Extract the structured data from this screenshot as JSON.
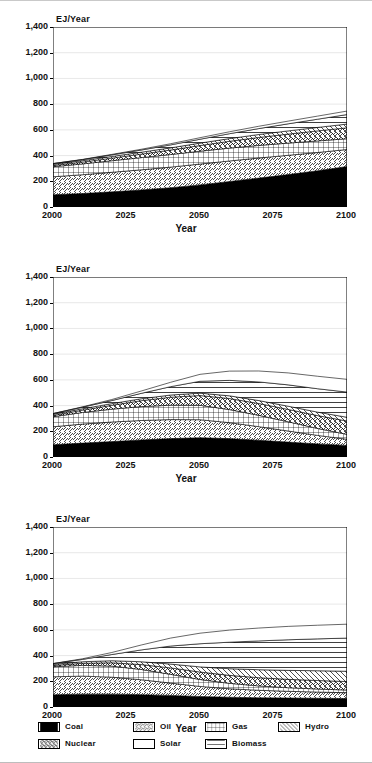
{
  "figure": {
    "background": "#ffffff",
    "frame_color": "#000000",
    "grid_color": "#d9d9d9"
  },
  "axis": {
    "ylabel": "EJ/Year",
    "xlabel": "Year",
    "yticks": [
      "1,400",
      "1,200",
      "1,000",
      "800",
      "600",
      "400",
      "200",
      "0"
    ],
    "ytick_values": [
      1400,
      1200,
      1000,
      800,
      600,
      400,
      200,
      0
    ],
    "xticks": [
      "2000",
      "2025",
      "2050",
      "2075",
      "2100"
    ],
    "xtick_values": [
      2000,
      2025,
      2050,
      2075,
      2100
    ],
    "ylim": [
      0,
      1400
    ],
    "xlim": [
      2000,
      2100
    ]
  },
  "legend": {
    "position": "bottom",
    "rows": [
      [
        {
          "label": "Coal",
          "pattern": "solid-black",
          "color": "#000000"
        },
        {
          "label": "Oil",
          "pattern": "diagonal-forward",
          "color": "#000000"
        },
        {
          "label": "Gas",
          "pattern": "grid-crosshatch",
          "color": "#000000"
        },
        {
          "label": "Hydro",
          "pattern": "diagonal-back",
          "color": "#000000"
        }
      ],
      [
        {
          "label": "Nuclear",
          "pattern": "diagonal-cross",
          "color": "#000000"
        },
        {
          "label": "Solar",
          "pattern": "blank-white",
          "color": "#ffffff"
        },
        {
          "label": "Biomass",
          "pattern": "horizontal-lines",
          "color": "#000000"
        }
      ]
    ]
  },
  "chart_data": [
    {
      "type": "area",
      "title": "",
      "stacked": true,
      "xlabel": "Year",
      "ylabel": "EJ/Year",
      "ylim": [
        0,
        1400
      ],
      "xlim": [
        2000,
        2100
      ],
      "grid": true,
      "legend": "shared-bottom",
      "x": [
        2000,
        2010,
        2020,
        2030,
        2040,
        2050,
        2060,
        2070,
        2080,
        2090,
        2100
      ],
      "series": [
        {
          "name": "Coal",
          "pattern": "solid-black",
          "values": [
            95,
            105,
            118,
            132,
            150,
            172,
            198,
            225,
            252,
            282,
            315
          ]
        },
        {
          "name": "Oil",
          "pattern": "diagonal-forward",
          "values": [
            140,
            146,
            152,
            157,
            160,
            162,
            160,
            156,
            150,
            142,
            132
          ]
        },
        {
          "name": "Gas",
          "pattern": "grid-crosshatch",
          "values": [
            78,
            84,
            90,
            95,
            98,
            100,
            100,
            98,
            95,
            90,
            84
          ]
        },
        {
          "name": "Nuclear",
          "pattern": "diagonal-cross",
          "values": [
            10,
            14,
            20,
            27,
            35,
            44,
            53,
            62,
            70,
            78,
            85
          ]
        },
        {
          "name": "Hydro",
          "pattern": "diagonal-back",
          "values": [
            9,
            11,
            13,
            15,
            17,
            19,
            21,
            23,
            25,
            27,
            29
          ]
        },
        {
          "name": "Biomass",
          "pattern": "horizontal-lines",
          "values": [
            5,
            8,
            12,
            17,
            23,
            30,
            38,
            46,
            55,
            64,
            74
          ]
        },
        {
          "name": "Solar",
          "pattern": "blank-white",
          "values": [
            1,
            2,
            4,
            6,
            9,
            12,
            15,
            18,
            21,
            24,
            27
          ]
        }
      ],
      "totals": [
        338,
        370,
        409,
        449,
        492,
        539,
        585,
        628,
        668,
        707,
        746
      ]
    },
    {
      "type": "area",
      "title": "",
      "stacked": true,
      "xlabel": "Year",
      "ylabel": "EJ/Year",
      "ylim": [
        0,
        1400
      ],
      "xlim": [
        2000,
        2100
      ],
      "grid": true,
      "legend": "shared-bottom",
      "x": [
        2000,
        2010,
        2020,
        2030,
        2040,
        2050,
        2060,
        2070,
        2080,
        2090,
        2100
      ],
      "series": [
        {
          "name": "Coal",
          "pattern": "solid-black",
          "values": [
            95,
            108,
            120,
            132,
            143,
            150,
            143,
            130,
            116,
            102,
            90
          ]
        },
        {
          "name": "Oil",
          "pattern": "diagonal-forward",
          "values": [
            140,
            148,
            152,
            152,
            148,
            140,
            124,
            106,
            86,
            66,
            48
          ]
        },
        {
          "name": "Gas",
          "pattern": "grid-crosshatch",
          "values": [
            78,
            90,
            100,
            108,
            112,
            112,
            102,
            88,
            72,
            54,
            38
          ]
        },
        {
          "name": "Nuclear",
          "pattern": "diagonal-cross",
          "values": [
            10,
            18,
            30,
            46,
            62,
            76,
            86,
            92,
            96,
            100,
            104
          ]
        },
        {
          "name": "Hydro",
          "pattern": "diagonal-back",
          "values": [
            9,
            11,
            13,
            15,
            17,
            19,
            21,
            23,
            25,
            27,
            29
          ]
        },
        {
          "name": "Biomass",
          "pattern": "horizontal-lines",
          "values": [
            5,
            12,
            24,
            42,
            65,
            92,
            120,
            145,
            166,
            182,
            196
          ]
        },
        {
          "name": "Solar",
          "pattern": "blank-white",
          "values": [
            1,
            3,
            8,
            18,
            34,
            54,
            72,
            85,
            93,
            97,
            99
          ]
        }
      ],
      "totals": [
        338,
        390,
        447,
        513,
        581,
        643,
        668,
        669,
        654,
        628,
        604
      ]
    },
    {
      "type": "area",
      "title": "",
      "stacked": true,
      "xlabel": "Year",
      "ylabel": "EJ/Year",
      "ylim": [
        0,
        1400
      ],
      "xlim": [
        2000,
        2100
      ],
      "grid": true,
      "legend": "shared-bottom",
      "x": [
        2000,
        2010,
        2020,
        2030,
        2040,
        2050,
        2060,
        2070,
        2080,
        2090,
        2100
      ],
      "series": [
        {
          "name": "Coal",
          "pattern": "solid-black",
          "values": [
            95,
            100,
            100,
            96,
            90,
            82,
            76,
            72,
            70,
            68,
            66
          ]
        },
        {
          "name": "Oil",
          "pattern": "diagonal-forward",
          "values": [
            140,
            140,
            132,
            116,
            96,
            78,
            66,
            58,
            52,
            48,
            45
          ]
        },
        {
          "name": "Gas",
          "pattern": "grid-crosshatch",
          "values": [
            78,
            84,
            86,
            80,
            68,
            54,
            42,
            34,
            28,
            24,
            21
          ]
        },
        {
          "name": "Nuclear",
          "pattern": "diagonal-cross",
          "values": [
            10,
            16,
            26,
            38,
            50,
            58,
            62,
            64,
            65,
            66,
            66
          ]
        },
        {
          "name": "Hydro",
          "pattern": "diagonal-back",
          "values": [
            9,
            12,
            16,
            22,
            30,
            40,
            52,
            62,
            70,
            76,
            80
          ]
        },
        {
          "name": "Biomass",
          "pattern": "horizontal-lines",
          "values": [
            5,
            18,
            48,
            92,
            140,
            180,
            206,
            224,
            238,
            248,
            258
          ]
        },
        {
          "name": "Solar",
          "pattern": "blank-white",
          "values": [
            1,
            5,
            16,
            38,
            62,
            82,
            94,
            100,
            104,
            106,
            108
          ]
        }
      ],
      "totals": [
        338,
        375,
        424,
        482,
        536,
        574,
        598,
        614,
        627,
        636,
        644
      ]
    }
  ]
}
